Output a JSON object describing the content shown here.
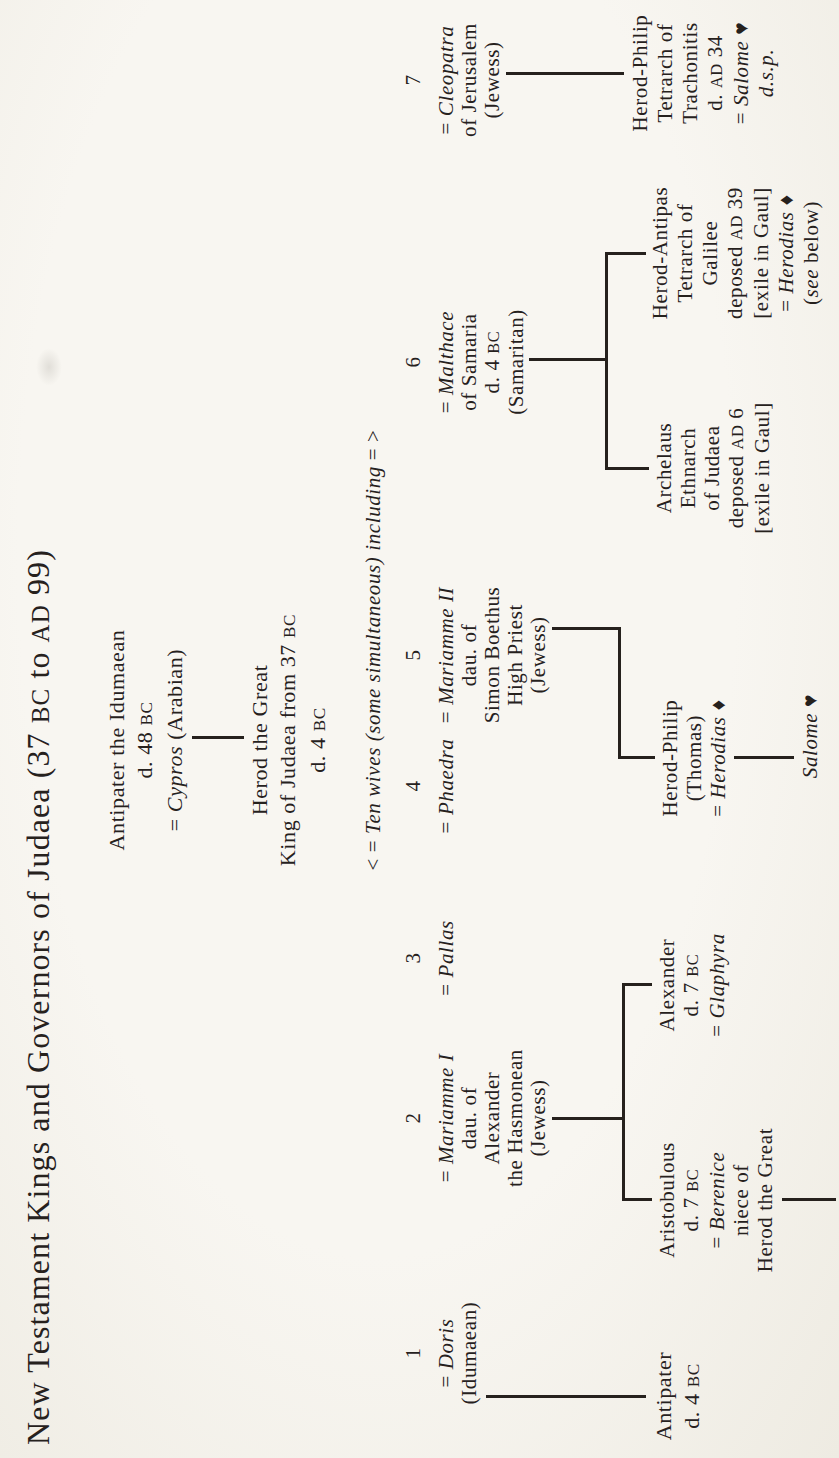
{
  "title": "New Testament Kings and Governors of Judaea (37 BC to AD 99)",
  "palette": {
    "background": "#f6f4ee",
    "ink": "#26211d"
  },
  "symbols": {
    "herodias_mark": "♦",
    "salome_mark": "♥"
  },
  "tree": {
    "nodes": [
      {
        "id": "antipater-idumaean",
        "cx": 718,
        "top": 103,
        "lh": 28,
        "fs": 22,
        "lines": [
          [
            [
              "Antipater the Idumaean",
              0
            ]
          ],
          [
            [
              "d. 48 BC",
              0
            ]
          ],
          [
            [
              "= ",
              0
            ],
            [
              "Cypros",
              1
            ],
            [
              " (Arabian)",
              0
            ]
          ]
        ]
      },
      {
        "id": "herod-the-great",
        "cx": 718,
        "top": 246,
        "lh": 28,
        "fs": 22,
        "lines": [
          [
            [
              "Herod the Great",
              0
            ]
          ],
          [
            [
              "King of Judaea from 37 BC",
              0
            ]
          ],
          [
            [
              "d. 4 BC",
              0
            ]
          ]
        ]
      },
      {
        "id": "ten-wives-note",
        "cx": 808,
        "top": 360,
        "lh": 26,
        "lines": [
          [
            [
              "< = ",
              0
            ],
            [
              "Ten wives (some simultaneous) including",
              1
            ],
            [
              " = >",
              0
            ]
          ]
        ]
      },
      {
        "id": "wife-1-doris",
        "cx": 105,
        "top": 402,
        "num": "1",
        "lh": 23,
        "lines": [
          [
            [
              "= ",
              0
            ],
            [
              "Doris",
              1
            ]
          ],
          [
            [
              "(Idumaean)",
              0
            ]
          ]
        ]
      },
      {
        "id": "wife-2-mariamme-i",
        "cx": 340,
        "top": 402,
        "num": "2",
        "lh": 23,
        "lines": [
          [
            [
              "= ",
              0
            ],
            [
              "Mariamme I",
              1
            ]
          ],
          [
            [
              "dau. of",
              0
            ]
          ],
          [
            [
              "Alexander",
              0
            ]
          ],
          [
            [
              "the Hasmonean",
              0
            ]
          ],
          [
            [
              "(Jewess)",
              0
            ]
          ]
        ]
      },
      {
        "id": "wife-3-pallas",
        "cx": 500,
        "top": 402,
        "num": "3",
        "lh": 23,
        "lines": [
          [
            [
              "= ",
              0
            ],
            [
              "Pallas",
              1
            ]
          ]
        ]
      },
      {
        "id": "wife-4-phaedra",
        "cx": 672,
        "top": 402,
        "num": "4",
        "lh": 23,
        "lines": [
          [
            [
              "= ",
              0
            ],
            [
              "Phaedra",
              1
            ]
          ]
        ]
      },
      {
        "id": "wife-5-mariamme-ii",
        "cx": 803,
        "top": 402,
        "num": "5",
        "lh": 23,
        "lines": [
          [
            [
              "= ",
              0
            ],
            [
              "Mariamme II",
              1
            ]
          ],
          [
            [
              "dau. of",
              0
            ]
          ],
          [
            [
              "Simon Boethus",
              0
            ]
          ],
          [
            [
              "High Priest",
              0
            ]
          ],
          [
            [
              "(Jewess)",
              0
            ]
          ]
        ]
      },
      {
        "id": "wife-6-malthace",
        "cx": 1096,
        "top": 402,
        "num": "6",
        "lh": 23,
        "lines": [
          [
            [
              "= ",
              0
            ],
            [
              "Malthace",
              1
            ]
          ],
          [
            [
              "of Samaria",
              0
            ]
          ],
          [
            [
              "d. 4 BC",
              0
            ]
          ],
          [
            [
              "(Samaritan)",
              0
            ]
          ]
        ]
      },
      {
        "id": "wife-7-cleopatra",
        "cx": 1378,
        "top": 402,
        "num": "7",
        "lh": 23,
        "lines": [
          [
            [
              "= ",
              0
            ],
            [
              "Cleopatra",
              1
            ]
          ],
          [
            [
              "of Jerusalem",
              0
            ]
          ],
          [
            [
              "(Jewess)",
              0
            ]
          ]
        ]
      },
      {
        "id": "son-antipater",
        "cx": 62,
        "top": 650,
        "lh": 28,
        "fs": 22,
        "lines": [
          [
            [
              "Antipater",
              0
            ]
          ],
          [
            [
              "d. 4 BC",
              0
            ]
          ]
        ]
      },
      {
        "id": "aristobulous",
        "cx": 258,
        "top": 655,
        "lh": 24,
        "lines": [
          [
            [
              "Aristobulous",
              0
            ]
          ],
          [
            [
              "d. 7 BC",
              0
            ]
          ],
          [
            [
              "= ",
              0
            ],
            [
              "Berenice",
              1
            ]
          ],
          [
            [
              "niece of",
              0
            ]
          ],
          [
            [
              "Herod the Great",
              0
            ]
          ]
        ]
      },
      {
        "id": "alexander",
        "cx": 473,
        "top": 655,
        "lh": 24,
        "lines": [
          [
            [
              "Alexander",
              0
            ]
          ],
          [
            [
              "d. 7 BC",
              0
            ]
          ],
          [
            [
              "= ",
              0
            ],
            [
              "Glaphyra",
              1
            ]
          ]
        ]
      },
      {
        "id": "herod-philip-thomas",
        "cx": 700,
        "top": 658,
        "lh": 24,
        "lines": [
          [
            [
              "Herod-Philip",
              0
            ]
          ],
          [
            [
              "(Thomas)",
              0
            ]
          ],
          [
            [
              "= ",
              0
            ],
            [
              "Herodias ",
              1
            ],
            [
              "♦",
              0
            ]
          ]
        ]
      },
      {
        "id": "salome-daughter",
        "cx": 722,
        "top": 798,
        "lh": 24,
        "lines": [
          [
            [
              "Salome ",
              1
            ],
            [
              "♥",
              0
            ]
          ]
        ]
      },
      {
        "id": "archelaus",
        "cx": 990,
        "top": 652,
        "lh": 24,
        "lines": [
          [
            [
              "Archelaus",
              0
            ]
          ],
          [
            [
              "Ethnarch",
              0
            ]
          ],
          [
            [
              "of Judaea",
              0
            ]
          ],
          [
            [
              "deposed AD 6",
              0
            ]
          ],
          [
            [
              "[exile in Gaul]",
              0
            ]
          ]
        ]
      },
      {
        "id": "herod-antipas",
        "cx": 1205,
        "top": 648,
        "lh": 25,
        "lines": [
          [
            [
              "Herod-Antipas",
              0
            ]
          ],
          [
            [
              "Tetrarch of",
              0
            ]
          ],
          [
            [
              "Galilee",
              0
            ]
          ],
          [
            [
              "deposed AD 39",
              0
            ]
          ],
          [
            [
              "[exile in Gaul]",
              0
            ]
          ],
          [
            [
              "= ",
              0
            ],
            [
              "Herodias ",
              1
            ],
            [
              "♦",
              0
            ]
          ],
          [
            [
              "(",
              0
            ],
            [
              "see",
              1
            ],
            [
              " below)",
              0
            ]
          ]
        ]
      },
      {
        "id": "herod-philip-trachonitis",
        "cx": 1385,
        "top": 628,
        "lh": 25,
        "lines": [
          [
            [
              "Herod-Philip",
              0
            ]
          ],
          [
            [
              "Tetrarch of",
              0
            ]
          ],
          [
            [
              "Trachonitis",
              0
            ]
          ],
          [
            [
              "d. AD 34",
              0
            ]
          ],
          [
            [
              "= ",
              0
            ],
            [
              "Salome ",
              1
            ],
            [
              "♥",
              0
            ]
          ],
          [
            [
              "d.s.p.",
              1
            ]
          ]
        ]
      }
    ],
    "connectors": [
      {
        "id": "antipater-to-herod",
        "x": 719,
        "y": 192,
        "w": 3,
        "h": 52
      },
      {
        "id": "doris-to-antipater",
        "x": 60,
        "y": 486,
        "w": 3,
        "h": 160
      },
      {
        "id": "mariamme1-drop",
        "x": 338,
        "y": 552,
        "w": 3,
        "h": 73
      },
      {
        "id": "mariamme1-bar",
        "x": 257,
        "y": 622,
        "w": 218,
        "h": 3
      },
      {
        "id": "mariamme1-stub-aristobulous",
        "x": 257,
        "y": 622,
        "w": 3,
        "h": 30
      },
      {
        "id": "mariamme1-stub-alexander",
        "x": 472,
        "y": 622,
        "w": 3,
        "h": 30
      },
      {
        "id": "aristobulous-continuation",
        "x": 257,
        "y": 782,
        "w": 3,
        "h": 54
      },
      {
        "id": "mariamme2-drop",
        "x": 828,
        "y": 552,
        "w": 3,
        "h": 69
      },
      {
        "id": "mariamme2-bar",
        "x": 699,
        "y": 618,
        "w": 132,
        "h": 3
      },
      {
        "id": "mariamme2-stub-thomas",
        "x": 699,
        "y": 618,
        "w": 3,
        "h": 37
      },
      {
        "id": "herodias-to-salome",
        "x": 699,
        "y": 734,
        "w": 3,
        "h": 60
      },
      {
        "id": "malthace-drop",
        "x": 1097,
        "y": 529,
        "w": 3,
        "h": 79
      },
      {
        "id": "malthace-bar",
        "x": 988,
        "y": 605,
        "w": 218,
        "h": 3
      },
      {
        "id": "malthace-stub-archelaus",
        "x": 988,
        "y": 605,
        "w": 3,
        "h": 44
      },
      {
        "id": "malthace-stub-antipas",
        "x": 1203,
        "y": 605,
        "w": 3,
        "h": 41
      },
      {
        "id": "cleopatra-drop",
        "x": 1383,
        "y": 506,
        "w": 3,
        "h": 118
      }
    ]
  }
}
